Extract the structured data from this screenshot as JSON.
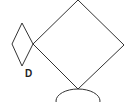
{
  "diagram": {
    "labels": {
      "small_diamond": "D"
    },
    "colors": {
      "stroke": "#333333",
      "background": "#ffffff",
      "text": "#222222"
    },
    "shapes": {
      "large_diamond": {
        "points": "78,0 124,45 78,89 33,44"
      },
      "small_diamond": {
        "points": "22,23 33,44 22,66 12,44"
      },
      "ellipse": {
        "cx": 78,
        "cy": 101,
        "rx": 22,
        "ry": 12
      }
    }
  }
}
